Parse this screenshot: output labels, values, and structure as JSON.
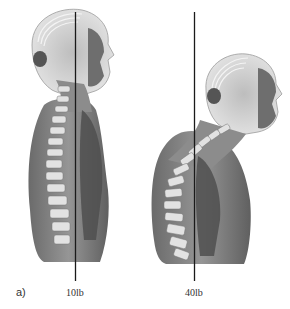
{
  "figure": {
    "panel_label": "a)",
    "figures": [
      {
        "posture": "upright",
        "load_label": "10lb"
      },
      {
        "posture": "forward-head",
        "load_label": "40lb"
      }
    ],
    "colors": {
      "ink": "#222222",
      "muscle": "#6b6b6b",
      "bone": "#d8d8d8",
      "line": "#1a1a1a"
    }
  }
}
